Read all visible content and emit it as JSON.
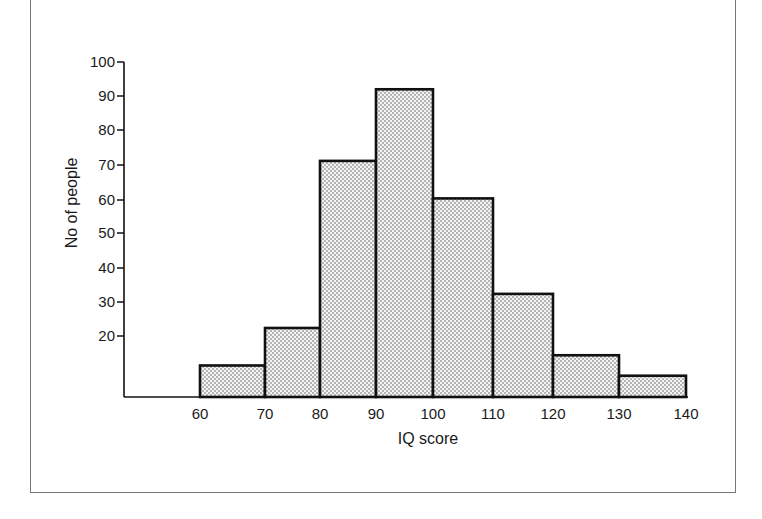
{
  "chart_data": {
    "type": "bar",
    "subtype": "histogram",
    "title": "",
    "xlabel": "IQ score",
    "ylabel": "No of people",
    "bins": [
      {
        "from": 60,
        "to": 70,
        "value": 11
      },
      {
        "from": 70,
        "to": 80,
        "value": 22
      },
      {
        "from": 80,
        "to": 90,
        "value": 71
      },
      {
        "from": 90,
        "to": 100,
        "value": 92
      },
      {
        "from": 100,
        "to": 110,
        "value": 60
      },
      {
        "from": 110,
        "to": 120,
        "value": 32
      },
      {
        "from": 120,
        "to": 130,
        "value": 14
      },
      {
        "from": 130,
        "to": 140,
        "value": 8
      }
    ],
    "categories": [
      "60-70",
      "70-80",
      "80-90",
      "90-100",
      "100-110",
      "110-120",
      "120-130",
      "130-140"
    ],
    "values": [
      11,
      22,
      71,
      92,
      60,
      32,
      14,
      8
    ],
    "x_tick_labels": [
      "60",
      "70",
      "80",
      "90",
      "100",
      "110",
      "120",
      "130",
      "140"
    ],
    "y_tick_labels": [
      "20",
      "30",
      "40",
      "50",
      "60",
      "70",
      "80",
      "90",
      "100"
    ],
    "ylim": [
      0,
      100
    ],
    "xlim": [
      50,
      140
    ],
    "grid": false,
    "legend": null,
    "bar_fill": "stippled dots",
    "colors": {
      "bar_outline": "#111111",
      "bar_fill": "#ececec",
      "dots": "#555555"
    }
  }
}
